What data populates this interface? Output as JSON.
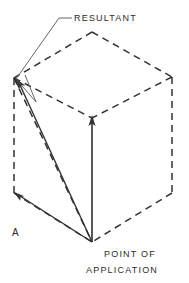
{
  "figure": {
    "background_color": "#ffffff",
    "line_color": "#333333",
    "dashed_color": "#333333",
    "width": 189,
    "height": 283,
    "labels": {
      "resultant": "RESULTANT",
      "part_label": "A",
      "point_of": "POINT OF",
      "application": "APPLICATION"
    },
    "geometry": {
      "point_of_application": {
        "x": 92,
        "y": 242
      },
      "top_vertex": {
        "x": 92,
        "y": 32
      },
      "left_vertex": {
        "x": 14,
        "y": 78
      },
      "right_vertex": {
        "x": 172,
        "y": 77
      },
      "center_top_vertex": {
        "x": 92,
        "y": 118
      },
      "left_bottom_vertex": {
        "x": 14,
        "y": 193
      },
      "right_bottom_vertex": {
        "x": 172,
        "y": 193
      }
    },
    "vectors": [
      {
        "name": "vertical-force-arrow",
        "from": {
          "x": 92,
          "y": 242
        },
        "to": {
          "x": 92,
          "y": 118
        },
        "style": "solid"
      },
      {
        "name": "horizontal-force-arrow",
        "from": {
          "x": 92,
          "y": 242
        },
        "to": {
          "x": 15,
          "y": 193
        },
        "style": "solid"
      },
      {
        "name": "resultant-arrow",
        "from": {
          "x": 92,
          "y": 242
        },
        "to": {
          "x": 15,
          "y": 78
        },
        "style": "solid"
      }
    ],
    "icons": {
      "arrowhead": "arrowhead-icon",
      "leader_line": "leader-line-icon"
    }
  }
}
